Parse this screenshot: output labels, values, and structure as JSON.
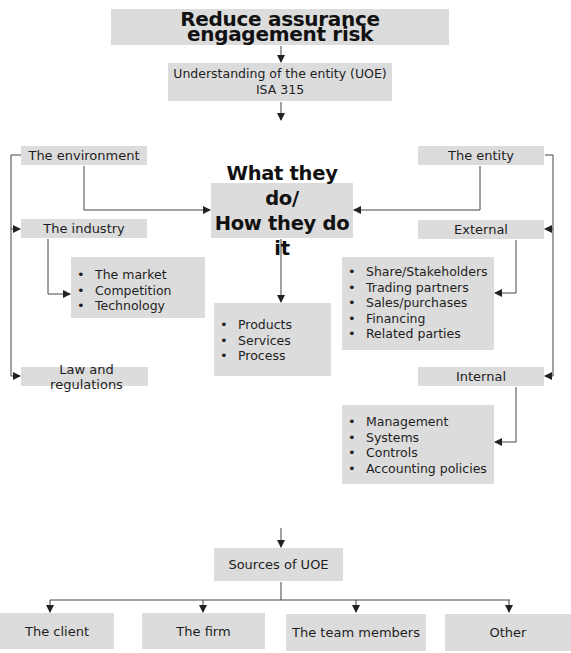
{
  "title": "Reduce assurance engagement risk",
  "uoe": {
    "line1": "Understanding of the entity (UOE)",
    "line2": "ISA 315"
  },
  "center": {
    "line1": "What they do/",
    "line2": "How they do it"
  },
  "left": {
    "environment": "The environment",
    "industry": "The industry",
    "industry_items": [
      "The market",
      "Competition",
      "Technology"
    ],
    "law": "Law and regulations"
  },
  "middle": {
    "items": [
      "Products",
      "Services",
      "Process"
    ]
  },
  "right": {
    "entity": "The entity",
    "external": "External",
    "external_items": [
      "Share/Stakeholders",
      "Trading partners",
      "Sales/purchases",
      "Financing",
      "Related parties"
    ],
    "internal": "Internal",
    "internal_items": [
      "Management",
      "Systems",
      "Controls",
      "Accounting policies"
    ]
  },
  "sources": {
    "title": "Sources of UOE",
    "items": [
      "The client",
      "The firm",
      "The team members",
      "Other"
    ]
  },
  "colors": {
    "box_fill": "#dcdcdc",
    "line": "#333333"
  }
}
